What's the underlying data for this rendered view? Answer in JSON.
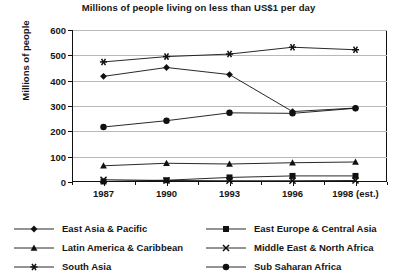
{
  "chart_data": {
    "type": "line",
    "title": "Millions of people living on less than US$1 per day",
    "xlabel": "",
    "ylabel": "Millions of people",
    "categories": [
      "1987",
      "1990",
      "1993",
      "1996",
      "1998 (est.)"
    ],
    "ylim": [
      0,
      600
    ],
    "ytick_labels": [
      "0",
      "100",
      "200",
      "300",
      "400",
      "500",
      "600"
    ],
    "ytick_values": [
      0,
      100,
      200,
      300,
      400,
      500,
      600
    ],
    "grid": true,
    "legend_position": "bottom",
    "series": [
      {
        "name": "East Asia & Pacific",
        "marker": "diamond",
        "values": [
          417,
          452,
          424,
          278,
          292
        ]
      },
      {
        "name": "East Europe & Central Asia",
        "marker": "square",
        "values": [
          2,
          7,
          18,
          24,
          24
        ]
      },
      {
        "name": "Latin America & Caribbean",
        "marker": "triangle",
        "values": [
          64,
          74,
          71,
          76,
          79
        ]
      },
      {
        "name": "Middle East & North Africa",
        "marker": "x",
        "values": [
          9,
          6,
          5,
          5,
          6
        ]
      },
      {
        "name": "South Asia",
        "marker": "asterisk",
        "values": [
          474,
          495,
          505,
          532,
          522
        ]
      },
      {
        "name": "Sub Saharan Africa",
        "marker": "circle",
        "values": [
          217,
          242,
          273,
          271,
          291
        ]
      }
    ]
  },
  "legend": {
    "columns": [
      {
        "entries": [
          {
            "label": "East Asia & Pacific",
            "marker": "diamond"
          },
          {
            "label": "Latin America & Caribbean",
            "marker": "triangle"
          },
          {
            "label": "South Asia",
            "marker": "asterisk"
          }
        ]
      },
      {
        "entries": [
          {
            "label": "East Europe & Central Asia",
            "marker": "square"
          },
          {
            "label": "Middle East & North Africa",
            "marker": "x"
          },
          {
            "label": "Sub Saharan Africa",
            "marker": "circle"
          }
        ]
      }
    ]
  },
  "colors": {
    "series": "#111111",
    "grid": "#b9b9b9",
    "axis": "#111111",
    "text": "#161616",
    "background": "#ffffff"
  }
}
